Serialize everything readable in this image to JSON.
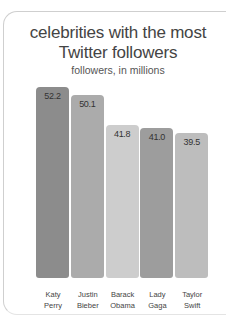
{
  "chart_data": {
    "type": "bar",
    "title": "celebrities with the most Twitter followers",
    "subtitle": "followers, in millions",
    "xlabel": "",
    "ylabel": "followers, in millions",
    "categories": [
      "Katy Perry",
      "Justin Bieber",
      "Barack Obama",
      "Lady Gaga",
      "Taylor Swift"
    ],
    "category_lines": [
      [
        "Katy",
        "Perry"
      ],
      [
        "Justin",
        "Bieber"
      ],
      [
        "Barack",
        "Obama"
      ],
      [
        "Lady",
        "Gaga"
      ],
      [
        "Taylor",
        "Swift"
      ]
    ],
    "values": [
      52.2,
      50.1,
      41.8,
      41.0,
      39.5
    ],
    "value_labels": [
      "52.2",
      "50.1",
      "41.8",
      "41.0",
      "39.5"
    ],
    "colors": [
      "#8c8c8c",
      "#ababab",
      "#cdcdcd",
      "#9d9d9d",
      "#bdbdbd"
    ],
    "grid": false,
    "legend": "none"
  }
}
